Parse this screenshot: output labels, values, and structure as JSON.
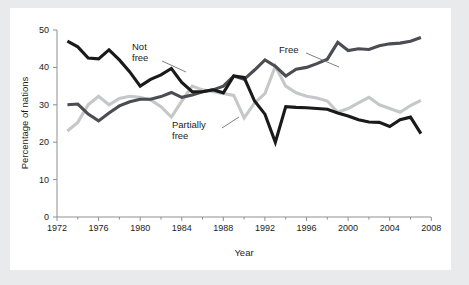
{
  "figure": {
    "background_color": "#e9eaec",
    "card_color": "#ffffff"
  },
  "chart_data": {
    "type": "line",
    "title": "",
    "subtitle": "",
    "xlabel": "Year",
    "ylabel": "Percentage of nations",
    "xlim": [
      1972,
      2008
    ],
    "ylim": [
      0,
      50
    ],
    "xticks": [
      1972,
      1976,
      1980,
      1984,
      1988,
      1992,
      1996,
      2000,
      2004,
      2008
    ],
    "xtick_labels": [
      "1972",
      "1976",
      "1980",
      "1984",
      "1988",
      "1992",
      "1996",
      "2000",
      "2004",
      "2008"
    ],
    "x_minor_ticks": [
      1974,
      1978,
      1982,
      1986,
      1990,
      1994,
      1998,
      2002,
      2006
    ],
    "yticks": [
      0,
      10,
      20,
      30,
      40,
      50
    ],
    "ytick_labels": [
      "0",
      "10",
      "20",
      "30",
      "40",
      "50"
    ],
    "grid": false,
    "legend_position": "inline-annotations",
    "x": [
      1973,
      1974,
      1975,
      1976,
      1977,
      1978,
      1979,
      1980,
      1981,
      1982,
      1983,
      1984,
      1985,
      1986,
      1987,
      1988,
      1989,
      1990,
      1991,
      1992,
      1993,
      1994,
      1995,
      1996,
      1997,
      1998,
      1999,
      2000,
      2001,
      2002,
      2003,
      2004,
      2005,
      2006,
      2007
    ],
    "series": [
      {
        "name": "Not free",
        "color": "#1a1a1a",
        "values": [
          47.0,
          45.5,
          42.5,
          42.3,
          44.7,
          42.0,
          38.8,
          35.0,
          36.8,
          38.0,
          39.7,
          36.0,
          33.5,
          33.5,
          34.0,
          33.2,
          37.7,
          37.3,
          31.0,
          27.5,
          20.0,
          29.5,
          29.3,
          29.2,
          29.0,
          28.8,
          27.8,
          27.0,
          26.0,
          25.4,
          25.3,
          24.2,
          26.0,
          26.7,
          22.3
        ]
      },
      {
        "name": "Free",
        "color": "#4a4e52",
        "values": [
          30.0,
          30.2,
          27.5,
          25.7,
          27.8,
          29.7,
          30.8,
          31.5,
          31.5,
          32.2,
          33.3,
          32.0,
          32.6,
          33.5,
          34.0,
          35.0,
          37.7,
          36.8,
          39.3,
          42.0,
          40.3,
          37.7,
          39.5,
          40.0,
          41.0,
          42.2,
          46.7,
          44.5,
          45.0,
          44.8,
          45.8,
          46.3,
          46.5,
          47.0,
          48.0
        ]
      },
      {
        "name": "Partially free",
        "color": "#c6c7c9",
        "values": [
          23.0,
          25.3,
          30.0,
          32.3,
          30.0,
          31.7,
          32.3,
          32.0,
          31.3,
          29.5,
          26.7,
          31.0,
          35.0,
          34.0,
          33.5,
          33.0,
          32.5,
          26.5,
          30.5,
          33.0,
          40.3,
          35.0,
          33.2,
          32.3,
          31.8,
          31.0,
          28.0,
          29.0,
          30.5,
          32.0,
          30.0,
          29.0,
          28.0,
          29.8,
          31.2
        ]
      }
    ],
    "annotations": [
      {
        "text_line1": "Not",
        "text_line2": "free",
        "series": "Not free"
      },
      {
        "text_line1": "Free",
        "text_line2": "",
        "series": "Free"
      },
      {
        "text_line1": "Partially",
        "text_line2": "free",
        "series": "Partially free"
      }
    ]
  }
}
